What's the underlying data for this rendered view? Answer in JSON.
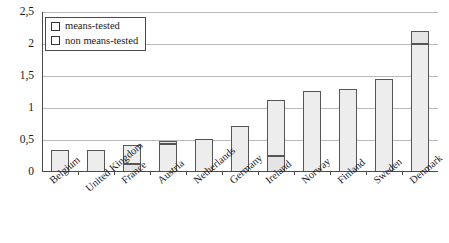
{
  "chart_data": {
    "type": "bar",
    "title": "",
    "xlabel": "",
    "ylabel": "",
    "ylim": [
      0,
      2.5
    ],
    "ytick_labels": [
      "0",
      "0,5",
      "1",
      "1,5",
      "2",
      "2,5"
    ],
    "ytick_values": [
      0,
      0.5,
      1,
      1.5,
      2,
      2.5
    ],
    "grid": true,
    "stacked": true,
    "legend_position": "top-left",
    "categories": [
      "Belgium",
      "United Kingdom",
      "France",
      "Austria",
      "Netherlands",
      "Germany",
      "Ireland",
      "Norway",
      "Finland",
      "Sweden",
      "Denmark"
    ],
    "series": [
      {
        "name": "means-tested",
        "values": [
          0,
          0,
          0.13,
          0.05,
          0,
          0,
          0.25,
          0,
          0,
          0,
          0.2
        ]
      },
      {
        "name": "non means-tested",
        "values": [
          0.35,
          0.35,
          0.29,
          0.43,
          0.52,
          0.72,
          0.87,
          1.27,
          1.3,
          1.45,
          2.0
        ]
      }
    ],
    "totals": [
      0.35,
      0.35,
      0.42,
      0.48,
      0.52,
      0.72,
      1.12,
      1.27,
      1.3,
      1.45,
      2.2
    ]
  },
  "legend": {
    "items": [
      {
        "label": "means-tested"
      },
      {
        "label": "non means-tested"
      }
    ]
  }
}
